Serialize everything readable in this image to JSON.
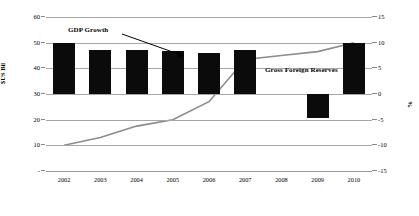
{
  "chart_data": {
    "type": "bar",
    "title": "",
    "xlabel": "",
    "ylabel": "$US Bil",
    "y2label": "%",
    "categories": [
      "2002",
      "2003",
      "2004",
      "2005",
      "2006",
      "2007",
      "2008",
      "2009",
      "2010"
    ],
    "grid": true,
    "legend_position": "inline-annotations",
    "ylim": [
      0,
      60
    ],
    "y2lim": [
      -15,
      15
    ],
    "yticks": [
      "-",
      "10",
      "20",
      "30",
      "40",
      "50",
      "60"
    ],
    "y2ticks": [
      "-15",
      "-10",
      "-5",
      "0",
      "5",
      "10",
      "15"
    ],
    "series": [
      {
        "name": "GDP Growth",
        "type": "bar",
        "axis": "right",
        "unit": "%",
        "color": "#0b0b0b",
        "values": [
          10.0,
          8.5,
          8.6,
          8.4,
          7.9,
          8.5,
          0.0,
          -4.7,
          9.9
        ]
      },
      {
        "name": "Gross Foreign Reserves",
        "type": "line",
        "axis": "left",
        "unit": "$US Bil",
        "color": "#8c8c8c",
        "values": [
          10.0,
          13.0,
          17.5,
          20.0,
          27.0,
          43.5,
          45.0,
          46.5,
          50.0
        ]
      }
    ],
    "annotations": [
      {
        "name": "GDP Growth",
        "label": "GDP Growth",
        "points_to": "2004"
      },
      {
        "name": "Gross Foreign Reserves",
        "label": "Gross Foreign Reserves",
        "points_to": "2008"
      }
    ]
  },
  "axes": {
    "left_title": "$US Bil",
    "right_title": "%",
    "left_ticks": [
      {
        "label": "60",
        "value": 60
      },
      {
        "label": "50",
        "value": 50
      },
      {
        "label": "40",
        "value": 40
      },
      {
        "label": "30",
        "value": 30
      },
      {
        "label": "20",
        "value": 20
      },
      {
        "label": "10",
        "value": 10
      },
      {
        "label": "-",
        "value": 0
      }
    ],
    "right_ticks": [
      {
        "label": "15",
        "value": 15
      },
      {
        "label": "10",
        "value": 10
      },
      {
        "label": "5",
        "value": 5
      },
      {
        "label": "0",
        "value": 0
      },
      {
        "label": "-5",
        "value": -5
      },
      {
        "label": "-10",
        "value": -10
      },
      {
        "label": "-15",
        "value": -15
      }
    ],
    "x_ticks": [
      "2002",
      "2003",
      "2004",
      "2005",
      "2006",
      "2007",
      "2008",
      "2009",
      "2010"
    ]
  },
  "annotations": {
    "gdp_growth_label": "GDP Growth",
    "reserves_label": "Gross Foreign Reserves"
  }
}
